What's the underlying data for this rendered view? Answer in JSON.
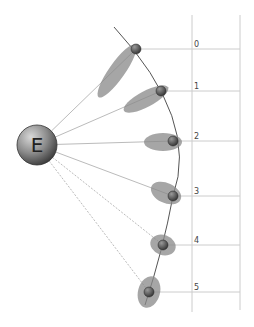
{
  "diagram": {
    "center_body": {
      "label": "E",
      "cx": 37,
      "cy": 145,
      "r": 20
    },
    "orbit_path_color": "#555555",
    "ray_color": "#bbbbbb",
    "grid_color": "#cccccc",
    "ellipse_color": "#888888",
    "moons": [
      {
        "label": "0",
        "cx": 136,
        "cy": 49,
        "ex": 117,
        "ey": 71,
        "rx": 32,
        "ry": 8,
        "rot": -55,
        "dashed": false
      },
      {
        "label": "1",
        "cx": 161,
        "cy": 91,
        "ex": 146,
        "ey": 99,
        "rx": 25,
        "ry": 8,
        "rot": -28,
        "dashed": false
      },
      {
        "label": "2",
        "cx": 173,
        "cy": 141,
        "ex": 163,
        "ey": 142,
        "rx": 19,
        "ry": 9,
        "rot": 0,
        "dashed": false
      },
      {
        "label": "3",
        "cx": 173,
        "cy": 196,
        "ex": 166,
        "ey": 193,
        "rx": 16,
        "ry": 10,
        "rot": 25,
        "dashed": false
      },
      {
        "label": "4",
        "cx": 163,
        "cy": 245,
        "ex": 163,
        "ey": 245,
        "rx": 13,
        "ry": 10,
        "rot": 20,
        "dashed": true
      },
      {
        "label": "5",
        "cx": 149,
        "cy": 292,
        "ex": 149,
        "ey": 292,
        "rx": 11,
        "ry": 16,
        "rot": 15,
        "dashed": true
      }
    ]
  }
}
